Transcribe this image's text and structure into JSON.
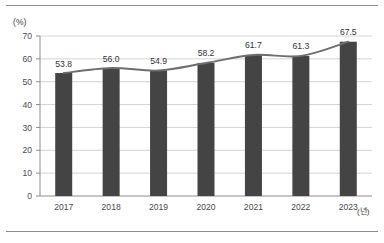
{
  "chart_data": {
    "type": "bar",
    "title": "",
    "subtitle": "",
    "xlabel": "(년)",
    "ylabel": "(%)",
    "categories": [
      "2017",
      "2018",
      "2019",
      "2020",
      "2021",
      "2022",
      "2023"
    ],
    "values": [
      53.8,
      56.0,
      54.9,
      58.2,
      61.7,
      61.3,
      67.5
    ],
    "value_labels": [
      "53.8",
      "56.0",
      "54.9",
      "58.2",
      "61.7",
      "61.3",
      "67.5"
    ],
    "ylim": [
      0,
      70
    ],
    "yticks": [
      0,
      10,
      20,
      30,
      40,
      50,
      60,
      70
    ],
    "ytick_labels": [
      "0",
      "10",
      "20",
      "30",
      "40",
      "50",
      "60",
      "70"
    ],
    "grid": true,
    "grid_axis": "y",
    "legend": false,
    "legend_position": "none",
    "series": [
      {
        "name": "bars",
        "type": "bar",
        "values": [
          53.8,
          56.0,
          54.9,
          58.2,
          61.7,
          61.3,
          67.5
        ],
        "color": "#444444"
      },
      {
        "name": "trend",
        "type": "line",
        "smooth": true,
        "values": [
          53.8,
          56.0,
          54.9,
          58.2,
          61.7,
          61.3,
          67.5
        ],
        "color": "#6e6e6e"
      }
    ],
    "colors": {
      "bar": "#444444",
      "line": "#6e6e6e",
      "grid": "#d4d4d4",
      "axis": "#8c8c8c",
      "text": "#3d3d3d",
      "background": "#ffffff",
      "rule": "#8c8c8c"
    }
  }
}
